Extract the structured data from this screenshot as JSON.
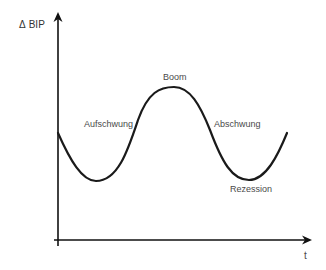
{
  "diagram": {
    "y_axis": {
      "symbol": "Δ",
      "label": "BIP"
    },
    "x_axis": {
      "label": "t"
    },
    "phases": [
      {
        "label": "Aufschwung"
      },
      {
        "label": "Boom"
      },
      {
        "label": "Abschwung"
      },
      {
        "label": "Rezession"
      }
    ],
    "colors": {
      "curve": "#1a1a1a",
      "axis": "#111111",
      "label": "#4a4a4a"
    }
  }
}
